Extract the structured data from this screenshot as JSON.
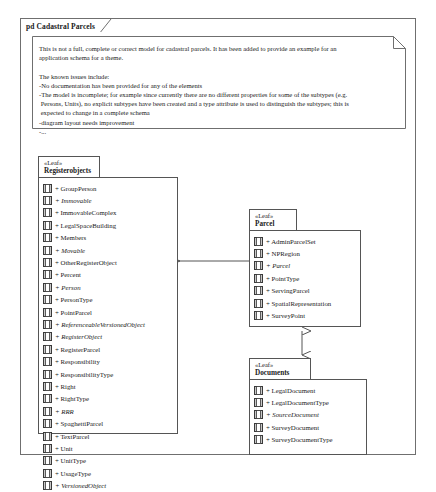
{
  "diagram": {
    "title": "pd Cadastral Parcels",
    "note": {
      "text": "This is not a full, complete or correct model for cadastral parcels. It has been added to provide an example for an\napplication schema for a theme.\n\nThe known issues include:\n-No documentation has been provided for any of the elements\n-The model is incomplete; for example since currently there are no different properties for some of the subtypes (e.g.\n Persons, Units), no explicit subtypes have been created and a type attribute is used to distinguish the subtypes; this is\n expected to change in a complete schema\n-diagram layout needs improvement\n-..."
    },
    "colors": {
      "frame_border": "#6f6f6f",
      "package_border": "#555555",
      "connector": "#555555",
      "icon_fill": "#c8c8c8",
      "background": "#ffffff",
      "text": "#1a1a1a"
    },
    "packages": [
      {
        "id": "registerobjects",
        "stereotype": "«Leaf»",
        "name": "Registerobjects",
        "items": [
          {
            "visibility": "+",
            "name": "GroupPerson",
            "abstract": false
          },
          {
            "visibility": "+",
            "name": "Immovable",
            "abstract": true
          },
          {
            "visibility": "+",
            "name": "ImmovableComplex",
            "abstract": false
          },
          {
            "visibility": "+",
            "name": "LegalSpaceBuilding",
            "abstract": false
          },
          {
            "visibility": "+",
            "name": "Members",
            "abstract": false
          },
          {
            "visibility": "+",
            "name": "Movable",
            "abstract": true
          },
          {
            "visibility": "+",
            "name": "OtherRegisterObject",
            "abstract": false
          },
          {
            "visibility": "+",
            "name": "Percent",
            "abstract": false
          },
          {
            "visibility": "+",
            "name": "Person",
            "abstract": true
          },
          {
            "visibility": "+",
            "name": "PersonType",
            "abstract": false
          },
          {
            "visibility": "+",
            "name": "PointParcel",
            "abstract": false
          },
          {
            "visibility": "+",
            "name": "ReferenceableVersionedObject",
            "abstract": true
          },
          {
            "visibility": "+",
            "name": "RegisterObject",
            "abstract": true
          },
          {
            "visibility": "+",
            "name": "RegisterParcel",
            "abstract": false
          },
          {
            "visibility": "+",
            "name": "Responsibility",
            "abstract": false
          },
          {
            "visibility": "+",
            "name": "ResponsibilityType",
            "abstract": false
          },
          {
            "visibility": "+",
            "name": "Right",
            "abstract": false
          },
          {
            "visibility": "+",
            "name": "RightType",
            "abstract": false
          },
          {
            "visibility": "+",
            "name": "RRR",
            "abstract": true
          },
          {
            "visibility": "+",
            "name": "SpaghettiParcel",
            "abstract": false
          },
          {
            "visibility": "+",
            "name": "TextParcel",
            "abstract": false
          },
          {
            "visibility": "+",
            "name": "Unit",
            "abstract": false
          },
          {
            "visibility": "+",
            "name": "UnitType",
            "abstract": false
          },
          {
            "visibility": "+",
            "name": "UsageType",
            "abstract": false
          },
          {
            "visibility": "+",
            "name": "VersionedObject",
            "abstract": true
          }
        ]
      },
      {
        "id": "parcel",
        "stereotype": "«Leaf»",
        "name": "Parcel",
        "items": [
          {
            "visibility": "+",
            "name": "AdminParcelSet",
            "abstract": false
          },
          {
            "visibility": "+",
            "name": "NPRegion",
            "abstract": false
          },
          {
            "visibility": "+",
            "name": "Parcel",
            "abstract": true
          },
          {
            "visibility": "+",
            "name": "PointType",
            "abstract": false
          },
          {
            "visibility": "+",
            "name": "ServingParcel",
            "abstract": false
          },
          {
            "visibility": "+",
            "name": "SpatialRepresentation",
            "abstract": false
          },
          {
            "visibility": "+",
            "name": "SurveyPoint",
            "abstract": false
          }
        ]
      },
      {
        "id": "documents",
        "stereotype": "«Leaf»",
        "name": "Documents",
        "items": [
          {
            "visibility": "+",
            "name": "LegalDocument",
            "abstract": false
          },
          {
            "visibility": "+",
            "name": "LegalDocumentType",
            "abstract": false
          },
          {
            "visibility": "+",
            "name": "SourceDocument",
            "abstract": true
          },
          {
            "visibility": "+",
            "name": "SurveyDocument",
            "abstract": false
          },
          {
            "visibility": "+",
            "name": "SurveyDocumentType",
            "abstract": false
          }
        ]
      }
    ],
    "connectors": [
      {
        "id": "registerobjects-parcel",
        "from": "registerobjects",
        "to": "parcel",
        "direction": "bidirectional",
        "orientation": "horizontal"
      },
      {
        "id": "parcel-documents",
        "from": "parcel",
        "to": "documents",
        "direction": "bidirectional",
        "orientation": "vertical"
      }
    ]
  }
}
